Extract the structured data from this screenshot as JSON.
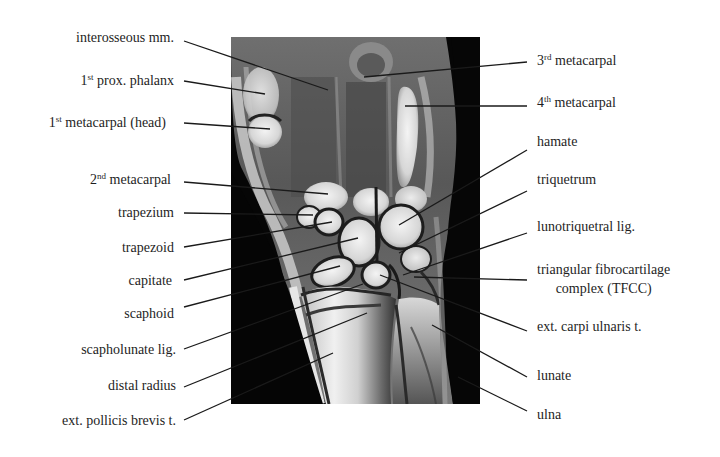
{
  "figure": {
    "type": "annotated coronal MRI of the wrist",
    "image_region": {
      "x": 231,
      "y": 37,
      "width": 249,
      "height": 367
    },
    "line_color": "#1a1a1a",
    "text_color": "#1e1e1e"
  },
  "labels_left": [
    {
      "id": "interosseous",
      "base": "interosseous mm.",
      "sup": "",
      "rest": "",
      "x_right": 174,
      "y": 38,
      "line": [
        184,
        41,
        328,
        90
      ]
    },
    {
      "id": "prox-phalanx",
      "num": "1",
      "sup": "st",
      "rest": " prox. phalanx",
      "x_right": 174,
      "y": 73,
      "line": [
        184,
        81,
        265,
        94
      ]
    },
    {
      "id": "metacarpal1-head",
      "num": "1",
      "sup": "st",
      "rest": " metacarpal (head)",
      "x_right": 166,
      "y": 115,
      "line": [
        184,
        123,
        270,
        129
      ]
    },
    {
      "id": "metacarpal2",
      "num": "2",
      "sup": "nd",
      "rest": " metacarpal",
      "x_right": 171,
      "y": 172,
      "line": [
        184,
        182,
        328,
        194
      ]
    },
    {
      "id": "trapezium",
      "base": "trapezium",
      "x_right": 174,
      "y": 205,
      "line": [
        184,
        213,
        313,
        215
      ]
    },
    {
      "id": "trapezoid",
      "base": "trapezoid",
      "x_right": 174,
      "y": 240,
      "line": [
        184,
        247,
        332,
        222
      ]
    },
    {
      "id": "capitate",
      "base": "capitate",
      "x_right": 172,
      "y": 273,
      "line": [
        184,
        280,
        358,
        238
      ]
    },
    {
      "id": "scaphoid",
      "base": "scaphoid",
      "x_right": 174,
      "y": 306,
      "line": [
        184,
        307,
        340,
        266
      ]
    },
    {
      "id": "scapholunate",
      "base": "scapholunate lig.",
      "x_right": 176,
      "y": 342,
      "line": [
        184,
        349,
        363,
        284
      ]
    },
    {
      "id": "distal-radius",
      "base": "distal radius",
      "x_right": 176,
      "y": 378,
      "line": [
        184,
        387,
        367,
        313
      ]
    },
    {
      "id": "epb-tendon",
      "base": "ext. pollicis brevis t.",
      "x_right": 176,
      "y": 413,
      "line": [
        184,
        420,
        333,
        353
      ]
    }
  ],
  "labels_right": [
    {
      "id": "metacarpal3",
      "num": "3",
      "sup": "rd",
      "rest": " metacarpal",
      "x": 537,
      "y": 53,
      "line": [
        527,
        62,
        364,
        77
      ]
    },
    {
      "id": "metacarpal4",
      "num": "4",
      "sup": "th",
      "rest": " metacarpal",
      "x": 537,
      "y": 95,
      "line": [
        527,
        106,
        405,
        106
      ]
    },
    {
      "id": "hamate",
      "base": "hamate",
      "x": 537,
      "y": 134,
      "line": [
        527,
        150,
        399,
        225
      ]
    },
    {
      "id": "triquetrum",
      "base": "triquetrum",
      "x": 537,
      "y": 172,
      "line": [
        527,
        191,
        399,
        253
      ]
    },
    {
      "id": "lunotriquetral",
      "base": "lunotriquetral lig.",
      "x": 537,
      "y": 219,
      "line": [
        527,
        233,
        403,
        275
      ]
    },
    {
      "id": "tfcc",
      "base": "triangular fibrocartilage",
      "base2": "complex (TFCC)",
      "x": 537,
      "y": 262,
      "line": [
        527,
        280,
        414,
        277
      ]
    },
    {
      "id": "ecu-tendon",
      "base": "ext. carpi ulnaris t.",
      "x": 537,
      "y": 319,
      "line": [
        527,
        331,
        380,
        275
      ]
    },
    {
      "id": "lunate",
      "base": "lunate",
      "x": 537,
      "y": 368,
      "line": [
        527,
        377,
        432,
        325
      ]
    },
    {
      "id": "ulna",
      "base": "ulna",
      "x": 537,
      "y": 407,
      "line": [
        527,
        411,
        458,
        377
      ]
    }
  ]
}
